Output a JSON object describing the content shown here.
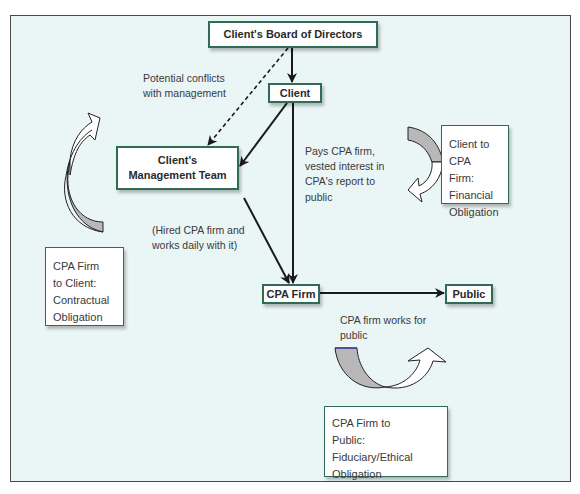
{
  "diagram": {
    "nodes": {
      "board": "Client's Board of Directors",
      "client": "Client",
      "management": [
        "Client's",
        "Management Team"
      ],
      "cpa_firm": "CPA Firm",
      "public": "Public"
    },
    "edge_labels": {
      "conflicts": [
        "Potential conflicts",
        "with management"
      ],
      "pays": [
        "Pays CPA firm,",
        "vested interest in",
        "CPA's report to",
        "public"
      ],
      "hired": [
        "(Hired CPA firm and",
        "works daily with it)"
      ],
      "works_for_public": [
        "CPA firm works for",
        "public"
      ]
    },
    "obligation_notes": {
      "client_to_cpa": [
        "Client to CPA",
        "Firm:",
        "Financial",
        "Obligation"
      ],
      "cpa_to_client": [
        "CPA Firm",
        "to Client:",
        "Contractual",
        "Obligation"
      ],
      "cpa_to_public": [
        "CPA Firm to",
        "Public:",
        "Fiduciary/Ethical",
        "Obligation"
      ]
    },
    "edges": [
      {
        "from": "board",
        "to": "client",
        "style": "solid"
      },
      {
        "from": "board",
        "to": "management",
        "style": "dashed"
      },
      {
        "from": "client",
        "to": "management",
        "style": "solid"
      },
      {
        "from": "client",
        "to": "cpa_firm",
        "style": "solid"
      },
      {
        "from": "management",
        "to": "cpa_firm",
        "style": "solid"
      },
      {
        "from": "cpa_firm",
        "to": "public",
        "style": "solid"
      }
    ],
    "colors": {
      "background": "#eaf5f5",
      "box_border": "#2f6b55",
      "arrow": "#1a1a1a",
      "curved_arrow_shade": "#b8b8b8"
    }
  }
}
